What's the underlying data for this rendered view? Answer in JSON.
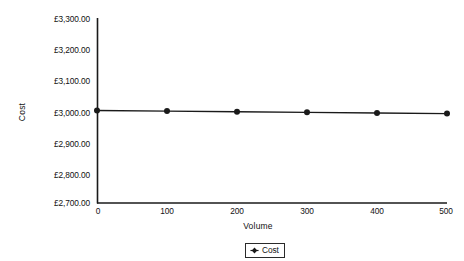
{
  "chart_data": {
    "type": "line",
    "title": "",
    "xlabel": "Volume",
    "ylabel": "Cost",
    "xlim": [
      0,
      500
    ],
    "ylim": [
      2700,
      3300
    ],
    "grid": false,
    "legend_position": "bottom",
    "x_ticks": [
      "0",
      "100",
      "200",
      "300",
      "400",
      "500"
    ],
    "y_ticks": [
      "£3,300.00",
      "£3,200.00",
      "£3,100.00",
      "£3,000.00",
      "£2,900.00",
      "£2,800.00",
      "£2,700.00"
    ],
    "x": [
      0,
      100,
      200,
      300,
      400,
      500
    ],
    "series": [
      {
        "name": "Cost",
        "values": [
          3000,
          2998,
          2996,
          2994,
          2992,
          2990
        ],
        "color": "#1a1a1a",
        "marker": "circle"
      }
    ]
  },
  "legend": {
    "entries": [
      {
        "label": "Cost",
        "marker": "diamond-marker",
        "color": "#1a1a1a"
      }
    ]
  },
  "axes": {
    "x_title": "Volume",
    "y_title": "Cost",
    "axis_color": "#1a1a1a"
  }
}
